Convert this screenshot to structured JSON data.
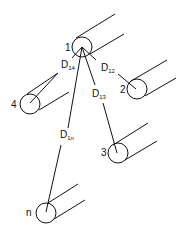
{
  "diagram": {
    "type": "conductor-spacing-diagram",
    "stroke_color": "#111111",
    "background": "#ffffff",
    "conductors": [
      {
        "id": "1",
        "label": "1",
        "cx": 82,
        "cy": 47,
        "r": 10
      },
      {
        "id": "2",
        "label": "2",
        "cx": 137,
        "cy": 89,
        "r": 10
      },
      {
        "id": "3",
        "label": "3",
        "cx": 118,
        "cy": 153,
        "r": 10
      },
      {
        "id": "4",
        "label": "4",
        "cx": 30,
        "cy": 104,
        "r": 10
      },
      {
        "id": "n",
        "label": "n",
        "cx": 46,
        "cy": 213,
        "r": 10
      }
    ],
    "distances": [
      {
        "from": "1",
        "to": "2",
        "label": "D",
        "sub": "12"
      },
      {
        "from": "1",
        "to": "3",
        "label": "D",
        "sub": "13"
      },
      {
        "from": "1",
        "to": "4",
        "label": "D",
        "sub": "14"
      },
      {
        "from": "1",
        "to": "n",
        "label": "D",
        "sub": "1n"
      }
    ]
  }
}
